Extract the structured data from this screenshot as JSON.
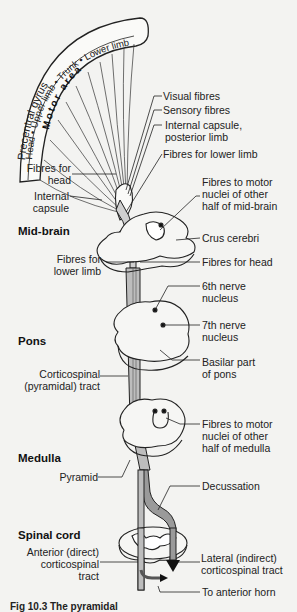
{
  "figure": {
    "motor_area": {
      "gyrus_label": "Precentral gyrus",
      "body_map": [
        "Head",
        "Upper limb",
        "Trunk",
        "Lower limb"
      ],
      "area_label": "Motor area"
    },
    "sections": {
      "midbrain": "Mid-brain",
      "pons": "Pons",
      "medulla": "Medulla",
      "spinal_cord": "Spinal cord"
    },
    "labels_right": {
      "visual_fibres": "Visual fibres",
      "sensory_fibres": "Sensory fibres",
      "internal_capsule_posterior_1": "Internal capsule,",
      "internal_capsule_posterior_2": "posterior limb",
      "fibres_lower_limb_top": "Fibres for lower limb",
      "motor_nuclei_midbrain_1": "Fibres to motor",
      "motor_nuclei_midbrain_2": "nuclei of other",
      "motor_nuclei_midbrain_3": "half of mid-brain",
      "crus_cerebri": "Crus cerebri",
      "fibres_head": "Fibres for head",
      "sixth_nerve_1": "6th nerve",
      "sixth_nerve_2": "nucleus",
      "seventh_nerve_1": "7th nerve",
      "seventh_nerve_2": "nucleus",
      "basilar_pons_1": "Basilar part",
      "basilar_pons_2": "of pons",
      "motor_nuclei_medulla_1": "Fibres to motor",
      "motor_nuclei_medulla_2": "nuclei of other",
      "motor_nuclei_medulla_3": "half of medulla",
      "decussation": "Decussation",
      "lateral_tract_1": "Lateral (indirect)",
      "lateral_tract_2": "corticospinal tract",
      "anterior_horn": "To anterior horn"
    },
    "labels_left": {
      "fibres_head_1": "Fibres for",
      "fibres_head_2": "head",
      "internal_capsule_1": "Internal",
      "internal_capsule_2": "capsule",
      "fibres_lower_limb_1": "Fibres for",
      "fibres_lower_limb_2": "lower limb",
      "corticospinal_1": "Corticospinal",
      "corticospinal_2": "(pyramidal) tract",
      "pyramid": "Pyramid",
      "anterior_tract_1": "Anterior (direct)",
      "anterior_tract_2": "corticospinal",
      "anterior_tract_3": "tract"
    },
    "caption": "Fig 10.3  The pyramidal"
  }
}
